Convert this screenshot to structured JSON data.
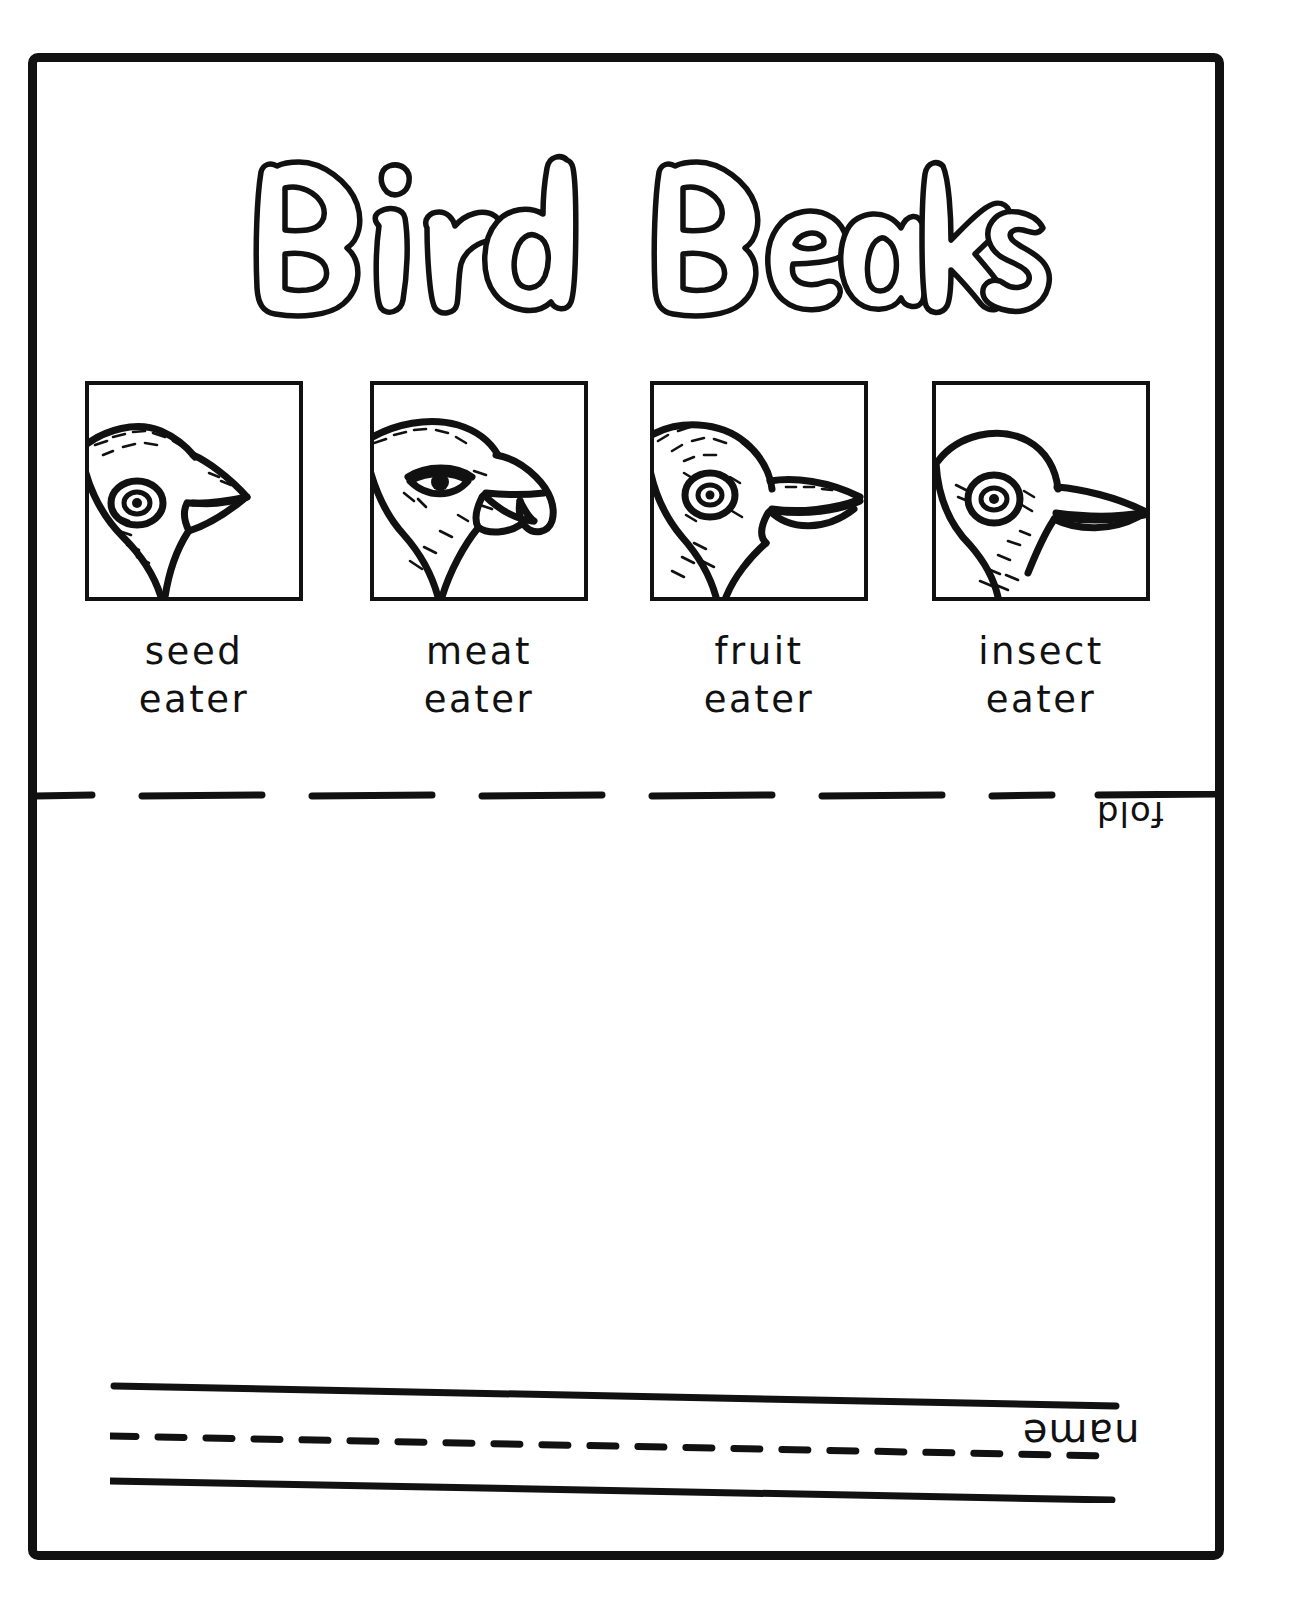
{
  "worksheet": {
    "title": "Bird Beaks",
    "fold_label": "fold",
    "name_label": "name",
    "border_color": "#111111",
    "ink_color": "#111111",
    "paper_color": "#ffffff"
  },
  "beak_panels": [
    {
      "id": "seed-eater",
      "label_line1": "seed",
      "label_line2": "eater",
      "beak_description": "short thick conical beak",
      "icon": "bird-head-seed-eater-icon"
    },
    {
      "id": "meat-eater",
      "label_line1": "meat",
      "label_line2": "eater",
      "beak_description": "sharply hooked raptor beak",
      "icon": "bird-head-meat-eater-icon"
    },
    {
      "id": "fruit-eater",
      "label_line1": "fruit",
      "label_line2": "eater",
      "beak_description": "broad heavy downcurved beak",
      "icon": "bird-head-fruit-eater-icon"
    },
    {
      "id": "insect-eater",
      "label_line1": "insect",
      "label_line2": "eater",
      "beak_description": "long slender pointed beak",
      "icon": "bird-head-insect-eater-icon"
    }
  ],
  "writing_lines": {
    "line_styles": [
      "solid",
      "dashed",
      "solid"
    ],
    "count": 3
  }
}
